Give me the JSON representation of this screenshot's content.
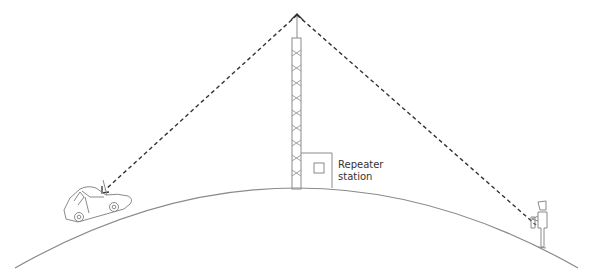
{
  "diagram": {
    "labels": {
      "repeater_line1": "Repeater",
      "repeater_line2": "station"
    },
    "elements": {
      "ground": "earth-curve",
      "tower": "antenna-tower",
      "station": "repeater-station-building",
      "vehicle": "car-with-antenna",
      "person": "person-with-handheld-radio",
      "links": [
        "tower-to-car-signal",
        "tower-to-person-signal"
      ]
    },
    "colors": {
      "stroke": "#8a8a8a",
      "dashed_line": "#333333",
      "text": "#333333",
      "background": "#ffffff"
    }
  }
}
